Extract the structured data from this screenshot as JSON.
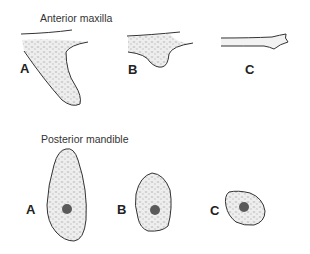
{
  "sections": {
    "anterior": {
      "title": "Anterior maxilla",
      "labels": [
        "A",
        "B",
        "C"
      ]
    },
    "posterior": {
      "title": "Posterior mandible",
      "labels": [
        "A",
        "B",
        "C"
      ]
    }
  },
  "colors": {
    "outline": "#333333",
    "bone_fill": "#ececec",
    "trabecular": "#c8c8c8",
    "canal": "#5a5a5a"
  }
}
